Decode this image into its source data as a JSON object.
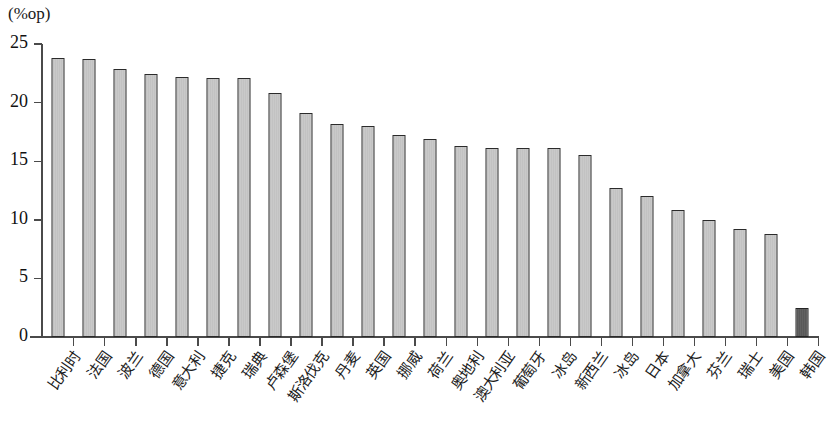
{
  "chart_data": {
    "type": "bar",
    "title": "",
    "subtitle": "",
    "xlabel": "",
    "ylabel": "(%op)",
    "ylim": [
      0,
      25
    ],
    "yticks": [
      0,
      5,
      10,
      15,
      20,
      25
    ],
    "grid": false,
    "legend": null,
    "categories": [
      "比利时",
      "法国",
      "波兰",
      "德国",
      "意大利",
      "捷克",
      "瑞典",
      "卢森堡",
      "斯洛伐克",
      "丹麦",
      "英国",
      "挪威",
      "荷兰",
      "奥地利",
      "澳大利亚",
      "葡萄牙",
      "冰岛",
      "新西兰",
      "冰岛",
      "日本",
      "加拿大",
      "芬兰",
      "瑞士",
      "美国",
      "韩国"
    ],
    "values": [
      23.8,
      23.7,
      22.9,
      22.4,
      22.2,
      22.1,
      22.1,
      20.8,
      19.1,
      18.2,
      18.0,
      17.2,
      16.9,
      16.3,
      16.1,
      16.1,
      16.1,
      15.5,
      12.7,
      12.0,
      10.8,
      10.0,
      9.2,
      8.8,
      2.5
    ],
    "highlight_index": 24,
    "colors": {
      "bar_fill": "#c9c9c9",
      "bar_stroke": "#2b2b2b",
      "highlight_fill": "#5d5d5d",
      "axis": "#4a4a4a",
      "text": "#111111",
      "background": "#ffffff"
    }
  }
}
